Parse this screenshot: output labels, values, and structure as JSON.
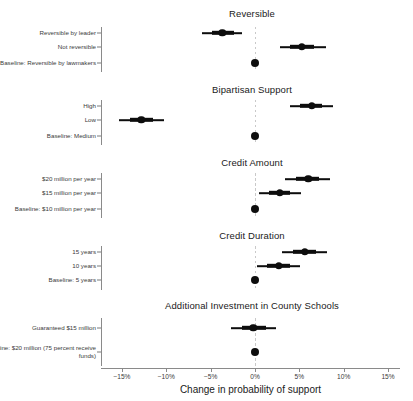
{
  "chart_data": {
    "type": "scatter",
    "title": "",
    "xlabel": "Change in probability of support",
    "ylabel": "",
    "xlim": [
      -17.5,
      17.5
    ],
    "xtick_labels": [
      "−15%",
      "−10%",
      "−5%",
      "0%",
      "5%",
      "10%",
      "15%"
    ],
    "xtick_values": [
      -15,
      -10,
      -5,
      0,
      5,
      10,
      15
    ],
    "grid": false,
    "legend": null,
    "zero_reference_line": 0,
    "units": "percentage points",
    "panels": [
      {
        "title": "Reversible",
        "points": [
          {
            "label": "Reversible by leader",
            "estimate": -3.7,
            "ci_inner": [
              -4.8,
              -2.4
            ],
            "ci_outer": [
              -6.0,
              -1.5
            ],
            "is_baseline": false
          },
          {
            "label": "Not reversible",
            "estimate": 5.3,
            "ci_inner": [
              4.0,
              6.6
            ],
            "ci_outer": [
              2.8,
              8.0
            ],
            "is_baseline": false
          },
          {
            "label": "Baseline: Reversible by lawmakers",
            "estimate": 0,
            "ci_inner": [
              0,
              0
            ],
            "ci_outer": [
              0,
              0
            ],
            "is_baseline": true
          }
        ]
      },
      {
        "title": "Bipartisan Support",
        "points": [
          {
            "label": "High",
            "estimate": 6.4,
            "ci_inner": [
              5.1,
              7.6
            ],
            "ci_outer": [
              3.9,
              8.8
            ],
            "is_baseline": false
          },
          {
            "label": "Low",
            "estimate": -12.8,
            "ci_inner": [
              -14.1,
              -11.5
            ],
            "ci_outer": [
              -15.3,
              -10.3
            ],
            "is_baseline": false
          },
          {
            "label": "Baseline: Medium",
            "estimate": 0,
            "ci_inner": [
              0,
              0
            ],
            "ci_outer": [
              0,
              0
            ],
            "is_baseline": true
          }
        ]
      },
      {
        "title": "Credit Amount",
        "points": [
          {
            "label": "$20 million per year",
            "estimate": 6.0,
            "ci_inner": [
              4.6,
              7.2
            ],
            "ci_outer": [
              3.4,
              8.4
            ],
            "is_baseline": false
          },
          {
            "label": "$15 million per year",
            "estimate": 2.8,
            "ci_inner": [
              1.6,
              4.0
            ],
            "ci_outer": [
              0.4,
              5.2
            ],
            "is_baseline": false
          },
          {
            "label": "Baseline: $10 million per year",
            "estimate": 0,
            "ci_inner": [
              0,
              0
            ],
            "ci_outer": [
              0,
              0
            ],
            "is_baseline": true
          }
        ]
      },
      {
        "title": "Credit Duration",
        "points": [
          {
            "label": "15 years",
            "estimate": 5.6,
            "ci_inner": [
              4.3,
              6.9
            ],
            "ci_outer": [
              3.1,
              8.1
            ],
            "is_baseline": false
          },
          {
            "label": "10 years",
            "estimate": 2.7,
            "ci_inner": [
              1.4,
              3.9
            ],
            "ci_outer": [
              0.2,
              5.1
            ],
            "is_baseline": false
          },
          {
            "label": "Baseline: 5 years",
            "estimate": 0,
            "ci_inner": [
              0,
              0
            ],
            "ci_outer": [
              0,
              0
            ],
            "is_baseline": true
          }
        ]
      },
      {
        "title": "Additional Investment in County Schools",
        "points": [
          {
            "label": "Guaranteed $15 million",
            "estimate": -0.2,
            "ci_inner": [
              -1.5,
              1.2
            ],
            "ci_outer": [
              -2.7,
              2.4
            ],
            "is_baseline": false
          },
          {
            "label": "Baseline: $20 million (75 percent receive funds)",
            "estimate": 0,
            "ci_inner": [
              0,
              0
            ],
            "ci_outer": [
              0,
              0
            ],
            "is_baseline": true
          }
        ]
      }
    ]
  }
}
